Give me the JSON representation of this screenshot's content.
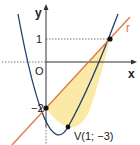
{
  "diagram": {
    "axes": {
      "x_label": "x",
      "y_label": "y",
      "origin_label": "O",
      "tick_y_positive": "1",
      "tick_y_negative": "−2"
    },
    "curves": {
      "parabola": {
        "equation": "y = x^2 - 2x - 2",
        "color": "#1f3f6e"
      },
      "line": {
        "name": "r",
        "equation": "y = x - 2",
        "color": "#e07a4a"
      }
    },
    "region_fill": "#fbe9a6",
    "points": {
      "vertex_label": "V(1; −3)",
      "intersection_a": "(0; −2)",
      "intersection_b": "(3; 1)"
    },
    "line_label": "r"
  }
}
